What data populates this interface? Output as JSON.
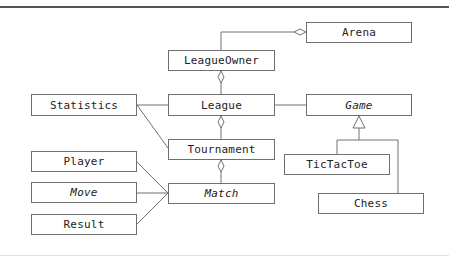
{
  "diagram": {
    "type": "UML class diagram",
    "classes": [
      {
        "id": "arena",
        "label": "Arena",
        "abstract": false
      },
      {
        "id": "league_owner",
        "label": "LeagueOwner",
        "abstract": false
      },
      {
        "id": "statistics",
        "label": "Statistics",
        "abstract": false
      },
      {
        "id": "league",
        "label": "League",
        "abstract": false
      },
      {
        "id": "game",
        "label": "Game",
        "abstract": true
      },
      {
        "id": "tournament",
        "label": "Tournament",
        "abstract": false
      },
      {
        "id": "tictactoe",
        "label": "TicTacToe",
        "abstract": false
      },
      {
        "id": "player",
        "label": "Player",
        "abstract": false
      },
      {
        "id": "match",
        "label": "Match",
        "abstract": true
      },
      {
        "id": "move",
        "label": "Move",
        "abstract": true
      },
      {
        "id": "chess",
        "label": "Chess",
        "abstract": false
      },
      {
        "id": "result",
        "label": "Result",
        "abstract": false
      }
    ],
    "relations": [
      {
        "from": "league_owner",
        "to": "arena",
        "type": "aggregation",
        "diamond_at": "arena"
      },
      {
        "from": "league",
        "to": "league_owner",
        "type": "aggregation",
        "diamond_at": "league_owner"
      },
      {
        "from": "tournament",
        "to": "league",
        "type": "aggregation",
        "diamond_at": "league"
      },
      {
        "from": "match",
        "to": "tournament",
        "type": "aggregation",
        "diamond_at": "tournament"
      },
      {
        "from": "statistics",
        "to": "league",
        "type": "association"
      },
      {
        "from": "statistics",
        "to": "tournament",
        "type": "association"
      },
      {
        "from": "league",
        "to": "game",
        "type": "association"
      },
      {
        "from": "tictactoe",
        "to": "game",
        "type": "generalization"
      },
      {
        "from": "chess",
        "to": "game",
        "type": "generalization"
      },
      {
        "from": "player",
        "to": "match",
        "type": "association"
      },
      {
        "from": "move",
        "to": "match",
        "type": "association"
      },
      {
        "from": "result",
        "to": "match",
        "type": "association"
      }
    ]
  }
}
